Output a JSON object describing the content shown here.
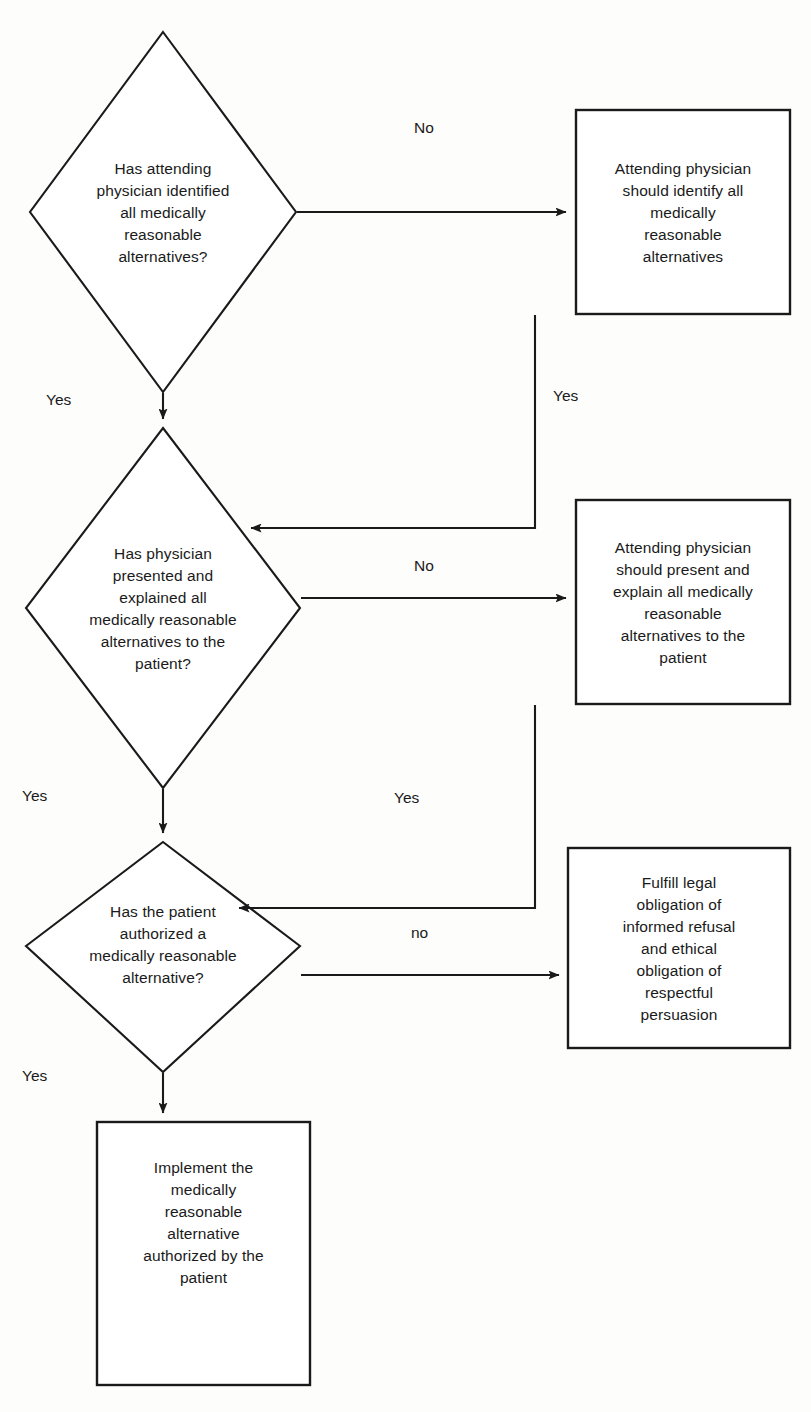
{
  "diagram": {
    "type": "flowchart",
    "orientation": "top-to-bottom",
    "stroke_color": "#1a1a1a",
    "fill_color": "#ffffff",
    "text_color": "#1a1a1a",
    "background_color": "#fdfdfc"
  },
  "nodes": {
    "decision1": {
      "shape": "diamond",
      "text": "Has attending\nphysician identified\nall medically\nreasonable\nalternatives?"
    },
    "process1": {
      "shape": "rectangle",
      "text": "Attending physician\nshould identify all\nmedically\nreasonable\nalternatives"
    },
    "decision2": {
      "shape": "diamond",
      "text": "Has physician\npresented and\nexplained all\nmedically reasonable\nalternatives to the\npatient?"
    },
    "process2": {
      "shape": "rectangle",
      "text": "Attending physician\nshould present and\nexplain all medically\nreasonable\nalternatives to the\npatient"
    },
    "decision3": {
      "shape": "diamond",
      "text": "Has the patient\nauthorized a\nmedically reasonable\nalternative?"
    },
    "process3": {
      "shape": "rectangle",
      "text": "Fulfill legal\nobligation of\ninformed refusal\nand ethical\nobligation of\nrespectful\npersuasion"
    },
    "process4": {
      "shape": "rectangle",
      "text": "Implement the\nmedically\nreasonable\nalternative\nauthorized by the\npatient"
    }
  },
  "edges": {
    "d1_no": {
      "label": "No",
      "from": "decision1",
      "to": "process1"
    },
    "d1_yes": {
      "label": "Yes",
      "from": "decision1",
      "to": "decision2"
    },
    "p1_yes": {
      "label": "Yes",
      "from": "process1",
      "to": "decision2"
    },
    "d2_no": {
      "label": "No",
      "from": "decision2",
      "to": "process2"
    },
    "d2_yes": {
      "label": "Yes",
      "from": "decision2",
      "to": "decision3"
    },
    "p2_yes": {
      "label": "Yes",
      "from": "process2",
      "to": "decision3"
    },
    "d3_no": {
      "label": "no",
      "from": "decision3",
      "to": "process3"
    },
    "d3_yes": {
      "label": "Yes",
      "from": "decision3",
      "to": "process4"
    }
  }
}
